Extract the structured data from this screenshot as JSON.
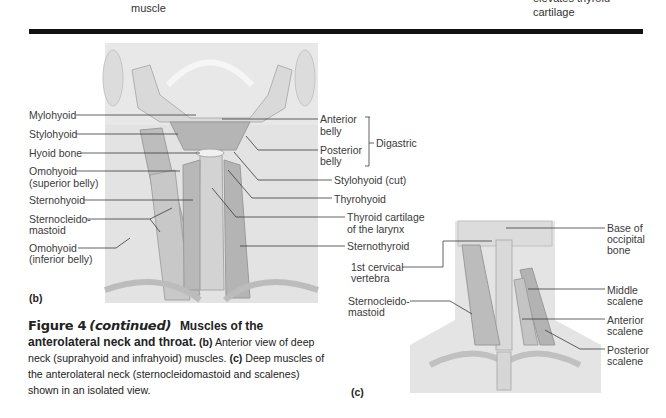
{
  "top_fragments": {
    "left_label": "muscle",
    "right_label_partial": "elevates thyroid",
    "right_label": "cartilage"
  },
  "panel_b": {
    "tag": "(b)",
    "left_labels": [
      {
        "lines": [
          "Mylohyoid"
        ]
      },
      {
        "lines": [
          "Stylohyoid"
        ]
      },
      {
        "lines": [
          "Hyoid bone"
        ]
      },
      {
        "lines": [
          "Omohyoid",
          "(superior belly)"
        ]
      },
      {
        "lines": [
          "Sternohyoid"
        ]
      },
      {
        "lines": [
          "Sternocleido-",
          "mastoid"
        ]
      },
      {
        "lines": [
          "Omohyoid",
          "(inferior belly)"
        ]
      }
    ],
    "right_labels": [
      {
        "lines": [
          "Anterior",
          "belly"
        ]
      },
      {
        "lines": [
          "Posterior",
          "belly"
        ]
      },
      {
        "lines": [
          "Stylohyoid (cut)"
        ]
      },
      {
        "lines": [
          "Thyrohyoid"
        ]
      },
      {
        "lines": [
          "Thyroid cartilage",
          "of the larynx"
        ]
      },
      {
        "lines": [
          "Sternothyroid"
        ]
      }
    ],
    "bracket_label": "Digastric"
  },
  "panel_c": {
    "tag": "(c)",
    "left_labels": [
      {
        "lines": [
          "1st cervical",
          "vertebra"
        ]
      },
      {
        "lines": [
          "Sternocleido-",
          "mastoid"
        ]
      }
    ],
    "right_labels": [
      {
        "lines": [
          "Base of",
          "occipital",
          "bone"
        ]
      },
      {
        "lines": [
          "Middle",
          "scalene"
        ]
      },
      {
        "lines": [
          "Anterior",
          "scalene"
        ]
      },
      {
        "lines": [
          "Posterior",
          "scalene"
        ]
      }
    ]
  },
  "caption": {
    "figure": "Figure 4",
    "continued": "(continued)",
    "title_1": "Muscles of the",
    "title_2": "anterolateral neck and throat.",
    "b_tag": "(b)",
    "b_text": "Anterior view of deep neck (suprahyoid and infrahyoid) muscles.",
    "c_tag": "(c)",
    "c_text": "Deep muscles of the anterolateral neck (sternocleidomastoid and scalenes) shown in an isolated view."
  },
  "colors": {
    "rule": "#111111",
    "illustration_bg": "#e6e6e6",
    "muscle": "#b9b9b9",
    "leader_line": "#3a3a3a"
  }
}
